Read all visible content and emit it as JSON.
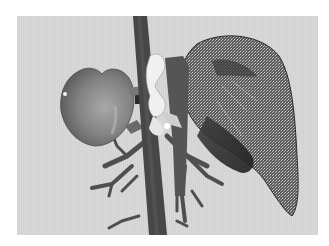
{
  "figure": {
    "kind": "3d-anatomical-rendering",
    "colors": {
      "page_background": "#ffffff",
      "scene_background": "#d9d9d9",
      "liver": "#7d7d7d",
      "liver_highlight": "#a5a5a5",
      "aorta": "#4a4a4a",
      "vessels": "#555555",
      "bone_highlight": "#f0f0f0",
      "lung_mesh": "#5c5c5c",
      "lung_dark": "#2e2e2e"
    },
    "structures": [
      {
        "id": "liver",
        "label": ""
      },
      {
        "id": "aorta",
        "label": ""
      },
      {
        "id": "vertebra",
        "label": ""
      },
      {
        "id": "vessel-tree",
        "label": ""
      },
      {
        "id": "lung-mesh",
        "label": ""
      }
    ]
  }
}
